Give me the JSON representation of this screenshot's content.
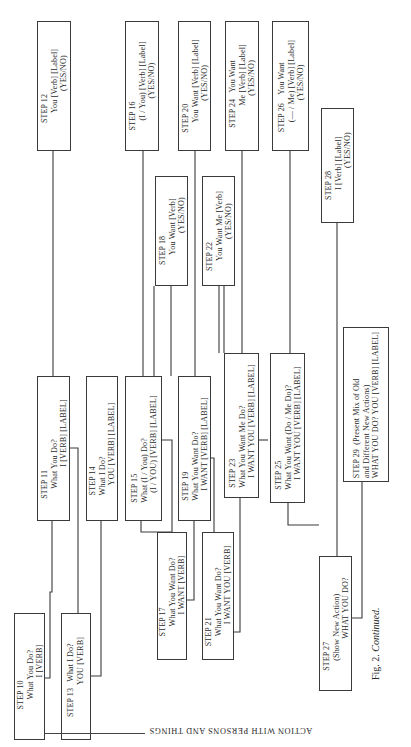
{
  "figure": {
    "caption_prefix": "Fig. 2.",
    "caption_suffix": "Continued.",
    "side_caption": "ACTION WITH PERSONS AND THINGS"
  },
  "steps": {
    "s10": {
      "label": "STEP 10",
      "lines": [
        "What You Do?",
        "I [VERB]"
      ]
    },
    "s11": {
      "label": "STEP 11",
      "lines": [
        "What You Do?",
        "I [VERB] [LABEL]"
      ]
    },
    "s12": {
      "label": "STEP 12",
      "lines": [
        "You [Verb] [Label]",
        "(YES/NO)"
      ]
    },
    "s13": {
      "label": "STEP 13",
      "lines": [
        "What I Do?",
        "YOU [VERB]"
      ]
    },
    "s14": {
      "label": "STEP 14",
      "lines": [
        "What I Do?",
        "YOU [VERB] [LABEL]"
      ]
    },
    "s15": {
      "label": "STEP 15",
      "lines": [
        "What (I / You) Do?",
        "(I / YOU) [VERB] [LABEL]"
      ]
    },
    "s16": {
      "label": "STEP 16",
      "lines": [
        "(I / You) [Verb] [Label]",
        "(YES/NO)"
      ]
    },
    "s17": {
      "label": "STEP 17",
      "lines": [
        "What You Want Do?",
        "I WANT [VERB]"
      ]
    },
    "s18": {
      "label": "STEP 18",
      "lines": [
        "You Want [Verb]",
        "(YES/NO)"
      ]
    },
    "s19": {
      "label": "STEP 19",
      "lines": [
        "What You Want Do?",
        "I WANT [VERB] [LABEL]"
      ]
    },
    "s20": {
      "label": "STEP 20",
      "lines": [
        "You Want [Verb] [Label]",
        "(YES/NO)"
      ]
    },
    "s21": {
      "label": "STEP 21",
      "lines": [
        "What You Want Do?",
        "I WANT YOU [VERB]"
      ]
    },
    "s22": {
      "label": "STEP 22",
      "lines": [
        "You Want Me [Verb]",
        "(YES/NO)"
      ]
    },
    "s23": {
      "label": "STEP 23",
      "lines": [
        "What You Want Me Do?",
        "I WANT YOU [VERB] [LABEL]"
      ]
    },
    "s24": {
      "label": "STEP 24",
      "lines": [
        "You Want",
        "Me [Verb] [Label]",
        "(YES/NO)"
      ]
    },
    "s25": {
      "label": "STEP 25",
      "lines": [
        "What You Want (Do / Me Do)?",
        "I WANT YOU [VERB] [LABEL]"
      ]
    },
    "s26": {
      "label": "STEP 26",
      "lines": [
        "You Want",
        "(— / Me) [Verb] [Label]",
        "(YES/NO)"
      ]
    },
    "s27": {
      "label": "STEP 27",
      "lines": [
        "(Show New Action)",
        "WHAT YOU DO?"
      ]
    },
    "s28": {
      "label": "STEP 28",
      "lines": [
        "I [Verb] [Label]",
        "(YES/NO)"
      ]
    },
    "s29": {
      "label": "STEP 29",
      "lines": [
        "(Present Mix of Old",
        "and Different New Actions)",
        "WHAT YOU DO?  YOU [VERB] [LABEL]"
      ]
    }
  },
  "colors": {
    "ink": "#2a2a2a",
    "paper": "#ffffff"
  }
}
